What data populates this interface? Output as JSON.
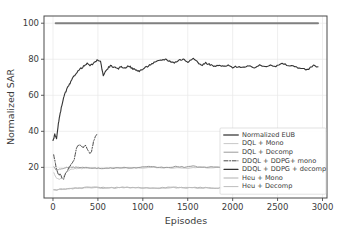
{
  "chart_data": {
    "type": "line",
    "title": "",
    "xlabel": "Episodes",
    "ylabel": "Normalized SAR",
    "xlim": [
      -100,
      3050
    ],
    "ylim": [
      3,
      104
    ],
    "xticks": [
      0,
      500,
      1000,
      1500,
      2000,
      2500,
      3000
    ],
    "yticks": [
      20,
      40,
      60,
      80,
      100
    ],
    "xtick_labels": [
      "0",
      "500",
      "1000",
      "1500",
      "2000",
      "2500",
      "3000"
    ],
    "ytick_labels": [
      "20",
      "40",
      "60",
      "80",
      "100"
    ],
    "grid": true,
    "legend_position": "center-right",
    "series": [
      {
        "name": "Normalized EUB",
        "color": "#808080",
        "style": "solid",
        "width": 2.0,
        "x": [
          30,
          2950
        ],
        "values": [
          100,
          100
        ]
      },
      {
        "name": "DQL + Mono",
        "color": "#c8c8c8",
        "style": "solid",
        "width": 1.0,
        "x": [
          10,
          40,
          70,
          110,
          150,
          200,
          260,
          320,
          400,
          480,
          560,
          650,
          760,
          880,
          1000,
          1120,
          1250,
          1380,
          1500,
          1620,
          1750,
          1880
        ],
        "values": [
          17.0,
          14.0,
          13.5,
          14.5,
          17.5,
          19.0,
          19.5,
          19.4,
          19.8,
          19.6,
          19.5,
          19.7,
          19.6,
          19.8,
          19.6,
          19.9,
          19.7,
          19.8,
          19.6,
          19.9,
          19.7,
          19.8
        ]
      },
      {
        "name": "DQL + Decomp",
        "color": "#9a9a9a",
        "style": "solid",
        "width": 1.0,
        "x": [
          10,
          35,
          60,
          90,
          120,
          160,
          210,
          270,
          330,
          400,
          470,
          540,
          620,
          700,
          790,
          880,
          970,
          1060,
          1160,
          1260,
          1360,
          1460,
          1560,
          1660,
          1760,
          1870
        ],
        "values": [
          20.5,
          18.5,
          18.8,
          19.2,
          19.6,
          20.0,
          20.1,
          19.9,
          20.2,
          19.8,
          19.6,
          19.4,
          19.5,
          19.7,
          19.8,
          19.6,
          20.0,
          20.3,
          20.1,
          19.9,
          20.4,
          20.2,
          20.6,
          20.1,
          20.3,
          20.0
        ]
      },
      {
        "name": "DDQL + DDPG+ mono",
        "color": "#4a4a4a",
        "style": "dashdot",
        "width": 1.0,
        "x": [
          8,
          20,
          35,
          50,
          65,
          80,
          100,
          120,
          140,
          160,
          185,
          210,
          235,
          260,
          285,
          310,
          335,
          360,
          385,
          410,
          430,
          450,
          470,
          490
        ],
        "values": [
          27.0,
          24.0,
          20.0,
          17.5,
          15.5,
          16.5,
          14.0,
          13.5,
          17.0,
          18.0,
          20.5,
          22.0,
          24.0,
          30.5,
          32.5,
          32.0,
          31.0,
          32.5,
          30.0,
          27.5,
          29.0,
          34.0,
          37.0,
          38.5
        ]
      },
      {
        "name": "DDQL + DDPG + decomp",
        "color": "#333333",
        "style": "solid",
        "width": 1.1,
        "x": [
          0,
          20,
          40,
          60,
          80,
          105,
          130,
          160,
          190,
          225,
          260,
          300,
          340,
          380,
          420,
          460,
          500,
          530,
          560,
          600,
          640,
          680,
          720,
          760,
          800,
          840,
          880,
          920,
          960,
          1000,
          1050,
          1100,
          1150,
          1200,
          1250,
          1300,
          1350,
          1400,
          1450,
          1500,
          1550,
          1600,
          1650,
          1700,
          1750,
          1800,
          1850,
          1900,
          1950,
          2000,
          2060,
          2120,
          2180,
          2240,
          2300,
          2360,
          2420,
          2480,
          2550,
          2620,
          2690,
          2760,
          2830,
          2900,
          2950
        ],
        "values": [
          34.5,
          38.5,
          36.0,
          44.0,
          50.0,
          56.0,
          60.5,
          64.0,
          66.5,
          70.0,
          72.5,
          74.5,
          76.0,
          77.5,
          76.5,
          78.0,
          79.8,
          78.5,
          71.0,
          74.5,
          76.5,
          75.5,
          74.5,
          76.0,
          75.0,
          76.5,
          75.0,
          74.0,
          73.5,
          74.5,
          76.0,
          77.5,
          78.5,
          79.5,
          80.0,
          79.0,
          78.0,
          79.5,
          80.0,
          78.5,
          80.5,
          79.0,
          76.5,
          78.0,
          77.0,
          76.0,
          76.5,
          76.0,
          76.5,
          75.5,
          76.0,
          75.5,
          76.0,
          75.5,
          76.5,
          76.0,
          77.0,
          76.0,
          77.5,
          76.5,
          76.0,
          75.0,
          74.0,
          76.5,
          75.8
        ]
      },
      {
        "name": "Heu + Mono",
        "color": "#b0b0b0",
        "style": "solid",
        "width": 1.0,
        "x": [
          10,
          60,
          120,
          200,
          300,
          400,
          500,
          620,
          740,
          860,
          980,
          1100,
          1220,
          1340,
          1460,
          1580,
          1700,
          1820,
          1880
        ],
        "values": [
          7.6,
          7.8,
          8.0,
          8.3,
          8.6,
          9.0,
          8.8,
          8.6,
          8.8,
          9.0,
          8.7,
          8.5,
          8.8,
          9.0,
          8.6,
          8.9,
          8.7,
          8.5,
          8.6
        ]
      },
      {
        "name": "Heu + Decomp",
        "color": "#bdbdbd",
        "style": "solid",
        "width": 1.0,
        "x": [
          10,
          70,
          140,
          220,
          320,
          430,
          540,
          660,
          790,
          920,
          1050,
          1180,
          1310,
          1440,
          1570,
          1700,
          1830,
          1880
        ],
        "values": [
          7.4,
          7.7,
          7.9,
          8.2,
          8.5,
          8.8,
          8.6,
          8.5,
          8.7,
          8.9,
          8.6,
          8.4,
          8.7,
          8.8,
          8.5,
          8.8,
          8.4,
          8.5
        ]
      }
    ]
  },
  "legend": {
    "entries": [
      {
        "label": "Normalized EUB"
      },
      {
        "label": "DQL + Mono"
      },
      {
        "label": "DQL + Decomp"
      },
      {
        "label": "DDQL + DDPG+ mono"
      },
      {
        "label": "DDQL + DDPG + decomp"
      },
      {
        "label": "Heu + Mono"
      },
      {
        "label": "Heu + Decomp"
      }
    ]
  }
}
